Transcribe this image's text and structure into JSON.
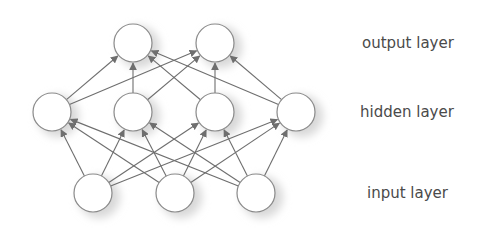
{
  "diagram": {
    "type": "feed-forward neural network",
    "colors": {
      "node_stroke": "#8a8a8a",
      "node_fill": "#ffffff",
      "edge": "#6e6e6e",
      "shadow": "#d8d8d8",
      "label": "#4a4a4a"
    },
    "node_radius": 19,
    "layers": [
      {
        "id": "output",
        "label": "output layer",
        "label_x": 362,
        "y": 43,
        "nodes_x": [
          133,
          215
        ]
      },
      {
        "id": "hidden",
        "label": "hidden layer",
        "label_x": 360,
        "y": 112,
        "nodes_x": [
          52,
          133,
          215,
          296
        ]
      },
      {
        "id": "input",
        "label": "input layer",
        "label_x": 367,
        "y": 193,
        "nodes_x": [
          93,
          175,
          256
        ]
      }
    ],
    "connections": "fully connected: input -> hidden -> output, arrows point upward"
  }
}
